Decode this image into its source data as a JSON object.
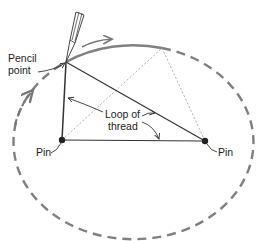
{
  "diagram": {
    "labels": {
      "pencil_point_line1": "Pencil",
      "pencil_point_line2": "point",
      "loop_line1": "Loop of",
      "loop_line2": "thread",
      "pin_left": "Pin",
      "pin_right": "Pin"
    },
    "colors": {
      "ellipse": "#808080",
      "thread": "#333333",
      "dotted": "#999999",
      "text": "#222222"
    }
  }
}
